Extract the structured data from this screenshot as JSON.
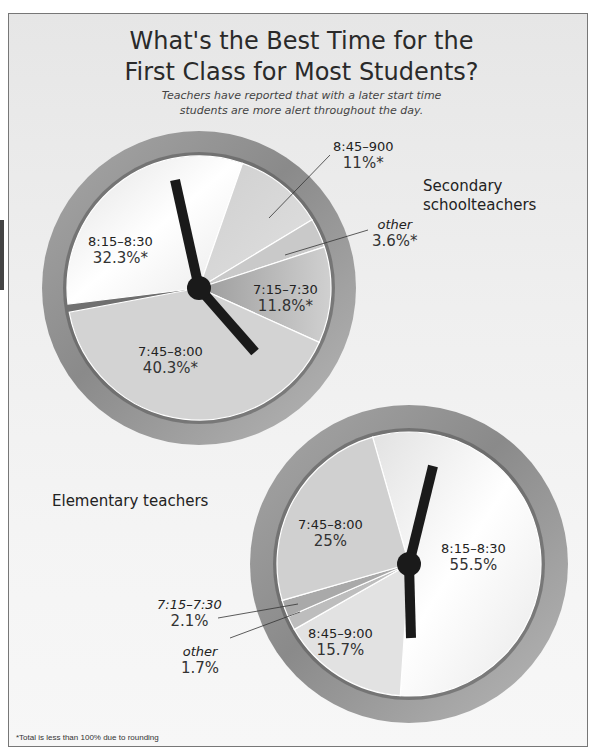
{
  "page": {
    "side_tab": true
  },
  "header": {
    "title_line1": "What's the Best Time for the",
    "title_line2": "First Class for Most Students?",
    "subtitle_line1": "Teachers have reported that with a later start time",
    "subtitle_line2": "students are more alert throughout the day."
  },
  "footnote": "*Total is less than 100% due to rounding",
  "colors": {
    "frame_border": "#777777",
    "clock_ring": "#8f8f8f",
    "hand": "#1a1a1a",
    "slice_light": "#f4f4f4",
    "slice_mid": "#d4d4d4",
    "slice_dark": "#b4b4b4"
  },
  "chart_data": [
    {
      "type": "pie",
      "title": "Secondary schoolteachers",
      "categories": [
        "8:15–8:30",
        "8:45–900",
        "other",
        "7:15–7:30",
        "7:45–8:00"
      ],
      "values": [
        32.3,
        11,
        3.6,
        11.8,
        40.3
      ],
      "value_labels": [
        "32.3%*",
        "11%*",
        "3.6%*",
        "11.8%*",
        "40.3%*"
      ],
      "note": "styled as a clock face; asterisk marks total less than 100% due to rounding"
    },
    {
      "type": "pie",
      "title": "Elementary teachers",
      "categories": [
        "8:15–8:30",
        "8:45–9:00",
        "other",
        "7:15–7:30",
        "7:45–8:00"
      ],
      "values": [
        55.5,
        15.7,
        1.7,
        2.1,
        25
      ],
      "value_labels": [
        "55.5%",
        "15.7%",
        "1.7%",
        "2.1%",
        "25%"
      ],
      "note": "styled as a clock face"
    }
  ],
  "secondary": {
    "group_title_line1": "Secondary",
    "group_title_line2": "schoolteachers",
    "labels": {
      "s815": {
        "time": "8:15–8:30",
        "pct": "32.3%*"
      },
      "s845": {
        "time": "8:45–900",
        "pct": "11%*"
      },
      "other": {
        "time": "other",
        "pct": "3.6%*"
      },
      "s715": {
        "time": "7:15–7:30",
        "pct": "11.8%*"
      },
      "s745": {
        "time": "7:45–8:00",
        "pct": "40.3%*"
      }
    }
  },
  "elementary": {
    "group_title": "Elementary teachers",
    "labels": {
      "s745": {
        "time": "7:45–8:00",
        "pct": "25%"
      },
      "s815": {
        "time": "8:15–8:30",
        "pct": "55.5%"
      },
      "s715": {
        "time": "7:15–7:30",
        "pct": "2.1%"
      },
      "other": {
        "time": "other",
        "pct": "1.7%"
      },
      "s845": {
        "time": "8:45–9:00",
        "pct": "15.7%"
      }
    }
  }
}
